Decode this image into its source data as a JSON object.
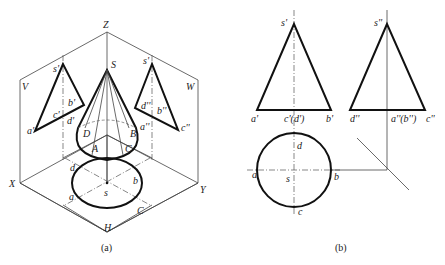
{
  "figure_a": {
    "caption": "(a)",
    "axes": {
      "z": "Z",
      "x": "X",
      "y": "Y",
      "h": "H"
    },
    "planes": {
      "v": "V",
      "w": "W"
    },
    "cone_apex": "S",
    "cone_points": {
      "a": "A",
      "b": "B",
      "c": "C",
      "d": "D"
    },
    "v_projection": {
      "apex": "s'",
      "a": "a'",
      "b": "b'",
      "c": "c'",
      "d": "d'"
    },
    "w_projection": {
      "apex": "s'",
      "a": "a''",
      "b": "b''",
      "c": "c''",
      "d": "d''"
    },
    "h_projection": {
      "center": "s",
      "a": "a",
      "b": "b",
      "c": "C",
      "d": "d"
    }
  },
  "figure_b": {
    "caption": "(b)",
    "front_view": {
      "apex": "s'",
      "a": "a'",
      "cd": "c'(d')",
      "b": "b'"
    },
    "side_view": {
      "apex": "s''",
      "d": "d''",
      "ab": "a''(b'')",
      "c": "c''"
    },
    "top_view": {
      "center": "s",
      "a": "a",
      "b": "b",
      "c": "c",
      "d": "d"
    }
  }
}
